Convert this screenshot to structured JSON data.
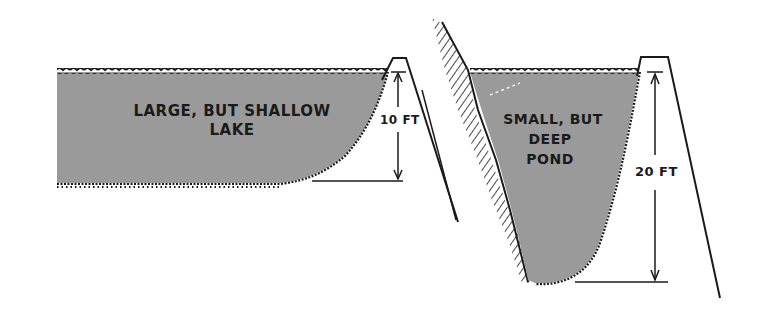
{
  "diagram": {
    "colors": {
      "water": "#9a9a9a",
      "ink": "#1a1a1a",
      "background": "#ffffff"
    },
    "lake": {
      "label_line1": "LARGE, BUT SHALLOW",
      "label_line2": "LAKE",
      "depth_label": "10 FT"
    },
    "pond": {
      "label_line1": "SMALL, BUT",
      "label_line2": "DEEP",
      "label_line3": "POND",
      "depth_label": "20 FT"
    }
  }
}
